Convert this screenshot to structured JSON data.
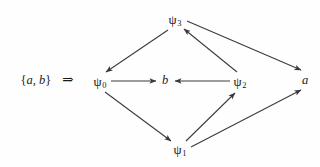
{
  "figure": {
    "background_color": "#fefefe",
    "ink_color": "#1a1a1a",
    "edge_color": "#3a3a3a",
    "width": 320,
    "height": 167
  },
  "premise": {
    "open_brace": "{",
    "set_elements": "a, b",
    "close_brace": "}",
    "implies_symbol": "⇒"
  },
  "chart_data": {
    "type": "diagram",
    "title": "",
    "nodes": [
      {
        "id": "psi3",
        "label": "ψ3",
        "symbol": "ψ",
        "subscript": "3",
        "kind": "state",
        "x": 175,
        "y": 20
      },
      {
        "id": "psi0",
        "label": "ψ0",
        "symbol": "ψ",
        "subscript": "0",
        "kind": "state",
        "x": 100,
        "y": 82
      },
      {
        "id": "b",
        "label": "b",
        "symbol": "b",
        "subscript": "",
        "kind": "atom",
        "x": 165,
        "y": 80
      },
      {
        "id": "psi2",
        "label": "ψ2",
        "symbol": "ψ",
        "subscript": "2",
        "kind": "state",
        "x": 240,
        "y": 82
      },
      {
        "id": "a",
        "label": "a",
        "symbol": "a",
        "subscript": "",
        "kind": "atom",
        "x": 305,
        "y": 80
      },
      {
        "id": "psi1",
        "label": "ψ1",
        "symbol": "ψ",
        "subscript": "1",
        "kind": "state",
        "x": 180,
        "y": 150
      }
    ],
    "edges": [
      {
        "from": "psi3",
        "to": "psi0",
        "x1": 168,
        "y1": 30,
        "x2": 106,
        "y2": 72,
        "directed": true
      },
      {
        "from": "psi0",
        "to": "b",
        "x1": 111,
        "y1": 81,
        "x2": 156,
        "y2": 81,
        "directed": true
      },
      {
        "from": "psi2",
        "to": "b",
        "x1": 230,
        "y1": 81,
        "x2": 175,
        "y2": 81,
        "directed": true
      },
      {
        "from": "psi2",
        "to": "psi3",
        "x1": 237,
        "y1": 72,
        "x2": 184,
        "y2": 29,
        "directed": true
      },
      {
        "from": "psi3",
        "to": "a",
        "x1": 187,
        "y1": 21,
        "x2": 301,
        "y2": 70,
        "directed": true
      },
      {
        "from": "psi0",
        "to": "psi1",
        "x1": 105,
        "y1": 92,
        "x2": 171,
        "y2": 141,
        "directed": true
      },
      {
        "from": "psi1",
        "to": "psi2",
        "x1": 186,
        "y1": 141,
        "x2": 235,
        "y2": 93,
        "directed": true
      },
      {
        "from": "psi1",
        "to": "a",
        "x1": 191,
        "y1": 147,
        "x2": 301,
        "y2": 90,
        "directed": true
      }
    ],
    "legend": [],
    "annotations": [
      {
        "id": "premise",
        "text": "{a, b}  ⇒",
        "x": 47,
        "y": 80
      }
    ]
  }
}
